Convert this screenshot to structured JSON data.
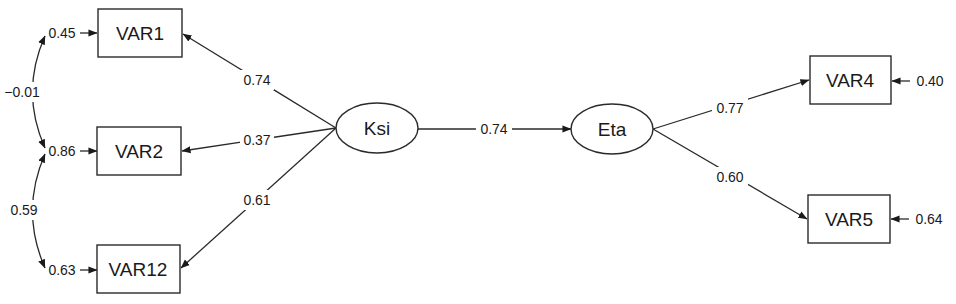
{
  "diagram": {
    "type": "structural-equation-path-diagram",
    "nodes": {
      "var1": {
        "label": "VAR1",
        "shape": "rect"
      },
      "var2": {
        "label": "VAR2",
        "shape": "rect"
      },
      "var12": {
        "label": "VAR12",
        "shape": "rect"
      },
      "ksi": {
        "label": "Ksi",
        "shape": "ellipse"
      },
      "eta": {
        "label": "Eta",
        "shape": "ellipse"
      },
      "var4": {
        "label": "VAR4",
        "shape": "rect"
      },
      "var5": {
        "label": "VAR5",
        "shape": "rect"
      }
    },
    "paths": {
      "ksi_var1": {
        "from": "Ksi",
        "to": "VAR1",
        "value": "0.74"
      },
      "ksi_var2": {
        "from": "Ksi",
        "to": "VAR2",
        "value": "0.37"
      },
      "ksi_var12": {
        "from": "Ksi",
        "to": "VAR12",
        "value": "0.61"
      },
      "ksi_eta": {
        "from": "Ksi",
        "to": "Eta",
        "value": "0.74"
      },
      "eta_var4": {
        "from": "Eta",
        "to": "VAR4",
        "value": "0.77"
      },
      "eta_var5": {
        "from": "Eta",
        "to": "VAR5",
        "value": "0.60"
      }
    },
    "errors": {
      "var1": "0.45",
      "var2": "0.86",
      "var12": "0.63",
      "var4": "0.40",
      "var5": "0.64"
    },
    "covariances": {
      "var1_var2": "−0.01",
      "var2_var12": "0.59"
    }
  }
}
